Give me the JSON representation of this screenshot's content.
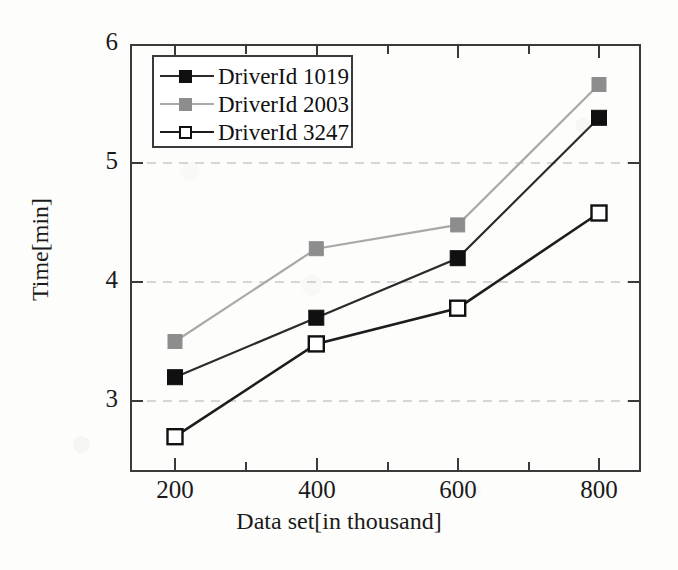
{
  "chart_data": {
    "type": "line",
    "title": "",
    "xlabel": "Data set[in thousand]",
    "ylabel": "Time[min]",
    "x": [
      200,
      400,
      600,
      800
    ],
    "categories": [
      "200",
      "400",
      "600",
      "800"
    ],
    "xticklabels": [
      "200",
      "400",
      "600",
      "800"
    ],
    "yticklabels": [
      "3",
      "4",
      "5",
      "6"
    ],
    "yticks": [
      3,
      4,
      5,
      6
    ],
    "xlim": [
      130,
      870
    ],
    "ylim": [
      2.44,
      6.0
    ],
    "grid": "horizontal-dashed",
    "legend_position": "upper-left-inside",
    "series": [
      {
        "name": "DriverId 1019",
        "values": [
          3.2,
          3.7,
          4.2,
          5.38
        ],
        "marker": "filled-square",
        "color": "#101010",
        "line_color": "#2b2b2b"
      },
      {
        "name": "DriverId 2003",
        "values": [
          3.5,
          4.28,
          4.48,
          5.66
        ],
        "marker": "filled-square-gray",
        "color": "#8d8d8d",
        "line_color": "#a9a9a9"
      },
      {
        "name": "DriverId 3247",
        "values": [
          2.7,
          3.48,
          3.78,
          4.58
        ],
        "marker": "open-square",
        "color": "#ffffff",
        "line_color": "#1d1d1d"
      }
    ]
  },
  "axes": {
    "y": {
      "label": "Time[min]",
      "ticks": [
        {
          "value": "6",
          "y": 44
        },
        {
          "value": "5",
          "y": 163
        },
        {
          "value": "4",
          "y": 282
        },
        {
          "value": "3",
          "y": 401
        }
      ]
    },
    "x": {
      "label": "Data set[in thousand]",
      "ticks": [
        {
          "value": "200",
          "x": 175
        },
        {
          "value": "400",
          "x": 317
        },
        {
          "value": "600",
          "x": 458
        },
        {
          "value": "800",
          "x": 599
        }
      ]
    }
  },
  "legend": {
    "entries": [
      {
        "label": "DriverId 1019",
        "marker": "filled-black-square",
        "line": "solid-dark"
      },
      {
        "label": "DriverId 2003",
        "marker": "filled-gray-square",
        "line": "solid-gray"
      },
      {
        "label": "DriverId 3247",
        "marker": "open-white-square",
        "line": "solid-dark"
      }
    ]
  },
  "colors": {
    "series_1019": "#101010",
    "series_2003": "#8d8d8d",
    "series_3247": "#ffffff",
    "axis": "#3a3a3a",
    "grid": "#c9c9c9",
    "text": "#1a1a1a",
    "background": "#fdfdfc"
  }
}
